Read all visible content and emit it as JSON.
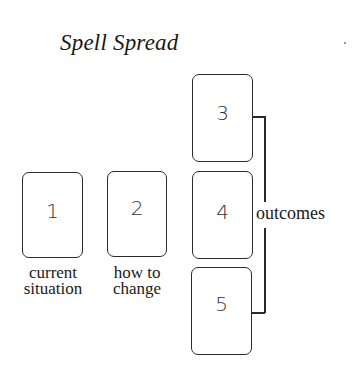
{
  "title": "Spell Spread",
  "cards": [
    {
      "number": "1",
      "label_line1": "current",
      "label_line2": "situation"
    },
    {
      "number": "2",
      "label_line1": "how to",
      "label_line2": "change"
    },
    {
      "number": "3"
    },
    {
      "number": "4"
    },
    {
      "number": "5"
    }
  ],
  "bracket_label": "outcomes"
}
